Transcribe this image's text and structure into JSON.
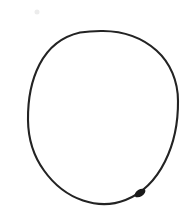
{
  "canvas": {
    "width": 196,
    "height": 223,
    "background_color": "#ffffff",
    "description": "hand-drawn circle outline in dark ink on plain white paper"
  },
  "artwork": {
    "name": "hand-drawn-circle",
    "shape": "circle",
    "medium": "pen-on-paper",
    "ink_color": "#232323",
    "ink_color_dark": "#1a1a1a",
    "closed": true,
    "filled": false,
    "stroke": {
      "min_width": 1.7,
      "max_width": 2.6,
      "nominal_width": 2.1
    },
    "geometry": {
      "center_x": 103,
      "center_y": 117,
      "radius_x": 75,
      "radius_y": 86,
      "left_x": 28,
      "right_x": 178,
      "top_y": 31,
      "bottom_y": 203
    },
    "outline_path": "M 103.0 31.0 C 124.0 31.2 143.0 38.5 156.5 50.5 C 170.5 63.0 178.0 81.5 178.0 101.0 C 178.2 122.0 174.0 143.5 165.0 161.5 C 156.0 179.5 142.0 193.5 125.5 200.0 C 112.0 205.3 96.5 205.0 83.0 200.5 C 67.5 195.3 54.0 184.5 44.0 170.5 C 33.5 156.0 28.2 138.0 28.0 120.0 C 27.8 101.0 31.0 81.0 39.5 64.5 C 48.0 48.0 62.5 36.5 80.0 32.5 C 87.5 31.3 95.3 30.9 103.0 31.0 Z"
  },
  "marks": [
    {
      "name": "ink-blob-lower-right",
      "description": "thickened ink blob where the pen pressed harder on the lower-right arc",
      "x": 140,
      "y": 193,
      "width": 12,
      "height": 7,
      "color": "#1a1a1a"
    },
    {
      "name": "faint-speck-upper-left",
      "description": "very faint gray speck on the paper above and left of the circle",
      "x": 37,
      "y": 12,
      "radius": 2.5,
      "color": "#ececec"
    }
  ]
}
